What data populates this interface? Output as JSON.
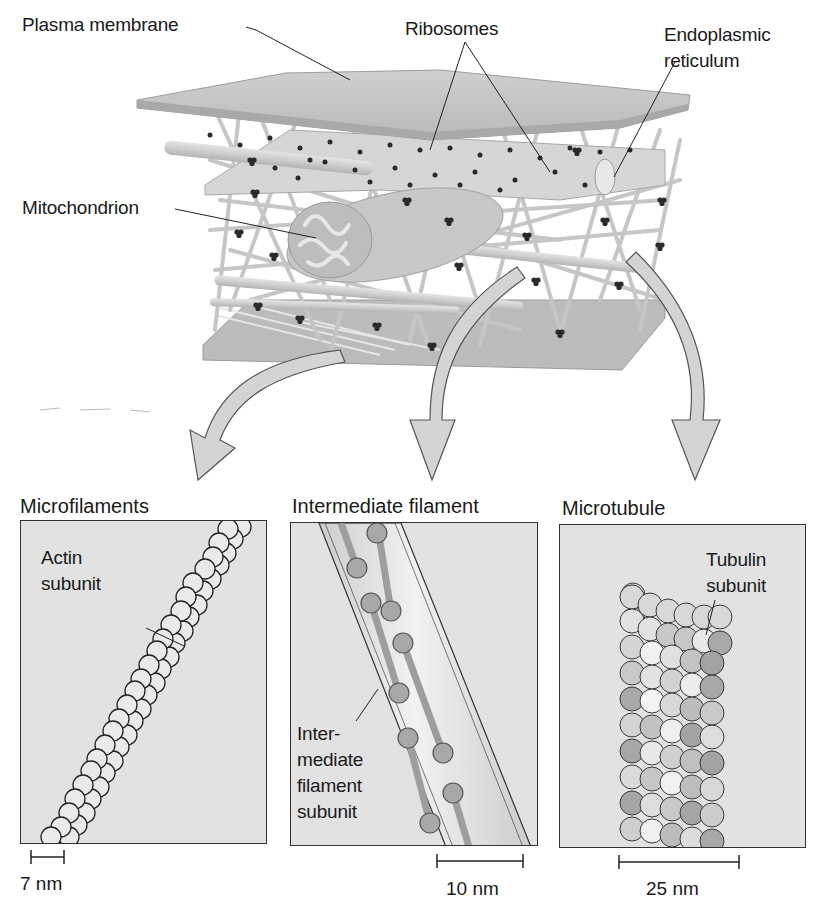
{
  "figure": {
    "top_labels": {
      "plasma_membrane": "Plasma membrane",
      "ribosomes": "Ribosomes",
      "endoplasmic_reticulum": "Endoplasmic\nreticulum",
      "mitochondrion": "Mitochondrion"
    },
    "panels": [
      {
        "title": "Microfilaments",
        "label": "Actin\nsubunit",
        "scale": "7 nm"
      },
      {
        "title": "Intermediate filament",
        "label": "Inter-\nmediate\nfilament\nsubunit",
        "scale": "10 nm"
      },
      {
        "title": "Microtubule",
        "label": "Tubulin\nsubunit",
        "scale": "25 nm"
      }
    ],
    "colors": {
      "membrane": "#bdbdbd",
      "filament": "#c9c9c9",
      "ribosome": "#2a2a2a",
      "panel_bg": "#e2e2e2",
      "arrow_fill": "#d4d4d4"
    }
  }
}
